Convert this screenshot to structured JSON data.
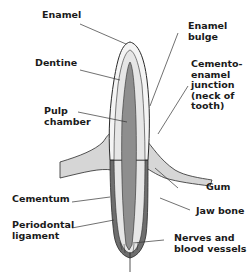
{
  "diagram": {
    "type": "anatomical cross-section",
    "subject": "tooth",
    "labels": {
      "enamel": "Enamel",
      "dentine": "Dentine",
      "pulp_chamber": "Pulp\nchamber",
      "enamel_bulge": "Enamel\nbulge",
      "cemento_enamel_junction": "Cemento-\nenamel\njunction\n(neck of\ntooth)",
      "cementum": "Cementum",
      "periodontal_ligament": "Periodontal\nligament",
      "gum": "Gum",
      "jaw_bone": "Jaw bone",
      "nerves_blood_vessels": "Nerves and\nblood vessels"
    },
    "colors": {
      "outline": "#2a2a2a",
      "enamel": "#f4f4f4",
      "dentine": "#dcdcdc",
      "pulp": "#8e8e8e",
      "cementum": "#6e6e6e",
      "gum": "#d6d6d6",
      "leader": "#333333"
    }
  }
}
